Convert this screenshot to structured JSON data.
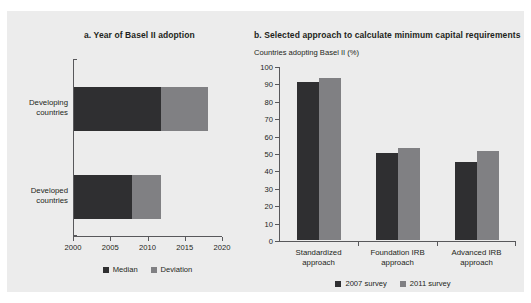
{
  "figure": {
    "background": "#ececec",
    "colors": {
      "dark": "#2f2f31",
      "light": "#808083",
      "axis": "#58585b",
      "text": "#231f20"
    }
  },
  "chart_data": [
    {
      "type": "bar",
      "orientation": "horizontal",
      "panel_label": "a.",
      "title": "a.  Year of Basel II adoption",
      "xlabel": "",
      "ylabel": "",
      "xlim": [
        2000,
        2020
      ],
      "xticks": [
        2000,
        2005,
        2010,
        2015,
        2020
      ],
      "xtick_labels": [
        "2000",
        "2005",
        "2010",
        "2015",
        "2020"
      ],
      "categories": [
        "Developing countries",
        "Developed countries"
      ],
      "category_lines": [
        [
          "Developing",
          "countries"
        ],
        [
          "Developed",
          "countries"
        ]
      ],
      "grid": false,
      "legend_position": "bottom",
      "series": [
        {
          "name": "Median",
          "color": "#2f2f31",
          "values": [
            2011.7,
            2007.8
          ]
        },
        {
          "name": "Deviation",
          "color": "#808083",
          "values": [
            2018.0,
            2011.7
          ]
        }
      ],
      "bars": [
        {
          "category": "Developing countries",
          "median_end": 2011.7,
          "deviation_end": 2018.0
        },
        {
          "category": "Developed countries",
          "median_end": 2007.8,
          "deviation_end": 2011.7
        }
      ]
    },
    {
      "type": "bar",
      "orientation": "vertical",
      "panel_label": "b.",
      "title": "b.  Selected approach to calculate minimum capital requirements",
      "axis_note": "Countries adopting Basel II (%)",
      "xlabel": "",
      "ylabel": "",
      "ylim": [
        0,
        100
      ],
      "yticks": [
        0,
        10,
        20,
        30,
        40,
        50,
        60,
        70,
        80,
        90,
        100
      ],
      "ytick_labels": [
        "0",
        "10",
        "20",
        "30",
        "40",
        "50",
        "60",
        "70",
        "80",
        "90",
        "100"
      ],
      "categories": [
        "Standardized approach",
        "Foundation IRB approach",
        "Advanced IRB approach"
      ],
      "category_lines": [
        [
          "Standardized",
          "approach"
        ],
        [
          "Foundation IRB",
          "approach"
        ],
        [
          "Advanced IRB",
          "approach"
        ]
      ],
      "grid": false,
      "legend_position": "bottom",
      "series": [
        {
          "name": "2007 survey",
          "color": "#2f2f31",
          "values": [
            91,
            50,
            45
          ]
        },
        {
          "name": "2011 survey",
          "color": "#808083",
          "values": [
            93,
            53,
            51
          ]
        }
      ]
    }
  ]
}
